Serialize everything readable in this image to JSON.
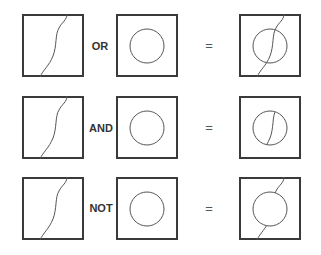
{
  "rows": [
    {
      "operator": "OR",
      "equals": "=",
      "result": "union"
    },
    {
      "operator": "AND",
      "equals": "=",
      "result": "intersection"
    },
    {
      "operator": "NOT",
      "equals": "=",
      "result": "difference"
    }
  ],
  "colors": {
    "stroke": "#3a3a3a",
    "shape": "#555555"
  }
}
